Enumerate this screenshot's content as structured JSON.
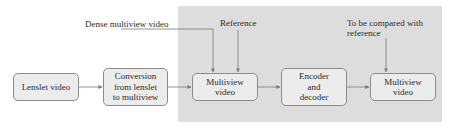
{
  "diagram": {
    "type": "flowchart",
    "colors": {
      "background": "#ffffff",
      "highlight_region": "#dddddd",
      "box_fill": "#ececec",
      "box_border": "#8c8c8c",
      "arrow": "#7a7a7a",
      "text": "#2b2b2b"
    },
    "nodes": [
      {
        "id": "lenslet",
        "label": "Lenslet video"
      },
      {
        "id": "conversion",
        "label": "Conversion\nfrom lenslet\nto multiview"
      },
      {
        "id": "multiview_in",
        "label": "Multiview\nvideo"
      },
      {
        "id": "codec",
        "label": "Encoder\nand\ndecoder"
      },
      {
        "id": "multiview_out",
        "label": "Multiview\nvideo"
      }
    ],
    "annotations": {
      "dense": "Dense multiview video",
      "reference": "Reference",
      "compare_line1": "To be compared with",
      "compare_line2": "reference"
    },
    "edges": [
      {
        "from": "lenslet",
        "to": "conversion"
      },
      {
        "from": "conversion",
        "to": "multiview_in"
      },
      {
        "from": "dense",
        "to": "multiview_in"
      },
      {
        "from": "reference",
        "to": "multiview_in"
      },
      {
        "from": "multiview_in",
        "to": "codec"
      },
      {
        "from": "codec",
        "to": "multiview_out"
      },
      {
        "from": "compare",
        "to": "multiview_out"
      }
    ]
  }
}
